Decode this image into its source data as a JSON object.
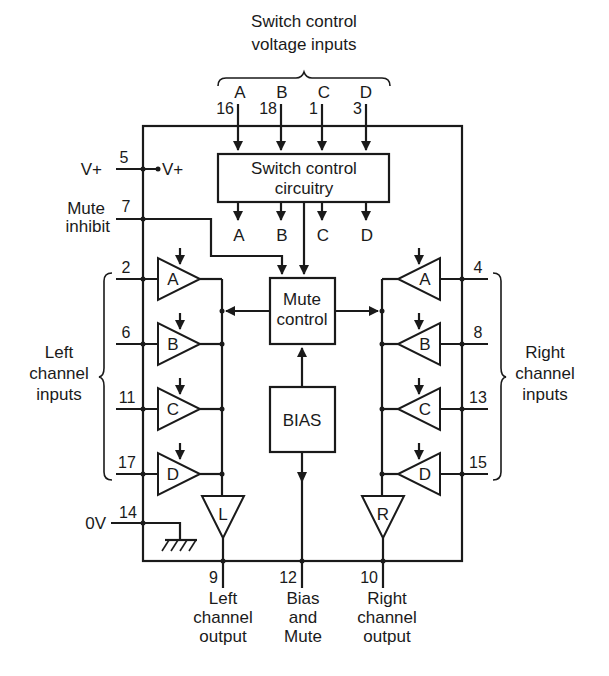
{
  "diagram": {
    "title_lines": [
      "Switch control",
      "voltage inputs"
    ],
    "switch_inputs": [
      {
        "letter": "A",
        "pin": "16"
      },
      {
        "letter": "B",
        "pin": "18"
      },
      {
        "letter": "C",
        "pin": "1"
      },
      {
        "letter": "D",
        "pin": "3"
      }
    ],
    "switch_block": {
      "lines": [
        "Switch control",
        "circuitry"
      ],
      "outputs": [
        "A",
        "B",
        "C",
        "D"
      ]
    },
    "supply": {
      "label": "V+",
      "pin": "5",
      "internal_label": "V+"
    },
    "mute_inhibit": {
      "lines": [
        "Mute",
        "inhibit"
      ],
      "pin": "7"
    },
    "mute_block": {
      "lines": [
        "Mute",
        "control"
      ]
    },
    "bias_block": {
      "label": "BIAS"
    },
    "left_inputs": {
      "group_lines": [
        "Left",
        "channel",
        "inputs"
      ],
      "channels": [
        {
          "letter": "A",
          "pin": "2"
        },
        {
          "letter": "B",
          "pin": "6"
        },
        {
          "letter": "C",
          "pin": "11"
        },
        {
          "letter": "D",
          "pin": "17"
        }
      ]
    },
    "right_inputs": {
      "group_lines": [
        "Right",
        "channel",
        "inputs"
      ],
      "channels": [
        {
          "letter": "A",
          "pin": "4"
        },
        {
          "letter": "B",
          "pin": "8"
        },
        {
          "letter": "C",
          "pin": "13"
        },
        {
          "letter": "D",
          "pin": "15"
        }
      ]
    },
    "ground": {
      "label": "0V",
      "pin": "14"
    },
    "outputs": [
      {
        "buffer": "L",
        "pin": "9",
        "lines": [
          "Left",
          "channel",
          "output"
        ]
      },
      {
        "pin": "12",
        "lines": [
          "Bias",
          "and",
          "Mute"
        ]
      },
      {
        "buffer": "R",
        "pin": "10",
        "lines": [
          "Right",
          "channel",
          "output"
        ]
      }
    ]
  }
}
